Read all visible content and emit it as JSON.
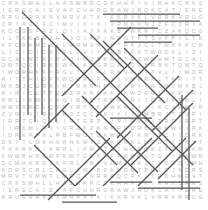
{
  "puzzle": {
    "type": "word-search",
    "title": "Word Search Puzzle",
    "grid_cols": 30,
    "grid_rows": 29,
    "letter_color": "#b9b9b9",
    "strike_color": "#565656",
    "background_color": "#ffffff",
    "rows": [
      "CRKSWHLLHASWRRCDKHHFIKIRHK",
      "JROKCATIERECAIEVAFCUHRGRAW",
      "KTKIKKRVKLVRRKRRUGRRKNXMRV",
      "IFCIMVIKIXIVPNKKNJZFCZRIAZ",
      "ZAKQCGGFRZLQIIAYFKKBIWKRIC",
      "RGTFTSVFPILTKKBRKHLJOIKPIN",
      "RRMVKTKTRKJCLTMKKFCRKMZWIL",
      "IDICXRFLLVIIFHBRFKTWRDKLIZ",
      "RHMTGCAIMTKIRAQIRQSKMKIRZW",
      "RGKJCGBRBKTQMTQCIRKIWKLKMG",
      "RGLIDIHLRKVKCTTVLIIWDRHKKY",
      "ITTHIDFXWQRRIFKIIVMMRKLTKR",
      "ITRTRVMXBJCGRKIRIRKRHPKKIR",
      "RRAFYKWDRRITKRIRICLTTRWZRK",
      "IIXQIBMKTRRMIRIJQAJKRRLIKM",
      "IMWVRMDLQFRYRTCKKWKWZIIIKC",
      "IIQMBRJTZVRIVIRVJROZQCRKIK",
      "TGRPTIRIRVKITRGIRRTCIQKLIR",
      "MLNJIVRZKZKNKRRDRBRKKWIIRK",
      "TCIIDRKFFKLRBFWCTQKWRIIKRI",
      "KQMKLMRDTIDKYTLMKHKRNKWIZR",
      "RLIFRXTNIHGRQKLFPTKKRKKIKR",
      "WRHRCMFKWTGCKKFPRKQLTGIIKW",
      "LTYDRDCMHKRRIKFRLYRFVDMLGK",
      "KFKMRRTRRIFJKDRSCRLCRGLKWI",
      "TLMRQINRRRQCFKITRKHMRVTVMW"
    ]
  },
  "solution_lines": [
    {
      "x1": 20,
      "y1": 27,
      "x2": 20,
      "y2": 140,
      "orientation": "vertical"
    },
    {
      "x1": 28,
      "y1": 27,
      "x2": 28,
      "y2": 115,
      "orientation": "vertical"
    },
    {
      "x1": 35,
      "y1": 38,
      "x2": 35,
      "y2": 122,
      "orientation": "vertical"
    },
    {
      "x1": 42,
      "y1": 38,
      "x2": 42,
      "y2": 115,
      "orientation": "vertical"
    },
    {
      "x1": 49,
      "y1": 45,
      "x2": 49,
      "y2": 128,
      "orientation": "vertical"
    },
    {
      "x1": 56,
      "y1": 45,
      "x2": 56,
      "y2": 122,
      "orientation": "vertical"
    },
    {
      "x1": 182,
      "y1": 95,
      "x2": 182,
      "y2": 190,
      "orientation": "vertical"
    },
    {
      "x1": 189,
      "y1": 108,
      "x2": 189,
      "y2": 200,
      "orientation": "vertical"
    },
    {
      "x1": 103,
      "y1": 14,
      "x2": 180,
      "y2": 14,
      "orientation": "horizontal"
    },
    {
      "x1": 110,
      "y1": 21,
      "x2": 200,
      "y2": 21,
      "orientation": "horizontal"
    },
    {
      "x1": 117,
      "y1": 28,
      "x2": 158,
      "y2": 28,
      "orientation": "horizontal"
    },
    {
      "x1": 138,
      "y1": 35,
      "x2": 200,
      "y2": 35,
      "orientation": "horizontal"
    },
    {
      "x1": 124,
      "y1": 42,
      "x2": 172,
      "y2": 42,
      "orientation": "horizontal"
    },
    {
      "x1": 110,
      "y1": 118,
      "x2": 152,
      "y2": 118,
      "orientation": "horizontal"
    },
    {
      "x1": 138,
      "y1": 188,
      "x2": 200,
      "y2": 188,
      "orientation": "horizontal"
    },
    {
      "x1": 158,
      "y1": 182,
      "x2": 200,
      "y2": 182,
      "orientation": "horizontal"
    },
    {
      "x1": 110,
      "y1": 182,
      "x2": 152,
      "y2": 182,
      "orientation": "horizontal"
    },
    {
      "x1": 20,
      "y1": 195,
      "x2": 96,
      "y2": 195,
      "orientation": "horizontal"
    },
    {
      "x1": 62,
      "y1": 202,
      "x2": 117,
      "y2": 202,
      "orientation": "horizontal"
    },
    {
      "x1": 22,
      "y1": 12,
      "x2": 96,
      "y2": 86,
      "orientation": "diagonal-down"
    },
    {
      "x1": 62,
      "y1": 34,
      "x2": 152,
      "y2": 124,
      "orientation": "diagonal-down"
    },
    {
      "x1": 90,
      "y1": 34,
      "x2": 124,
      "y2": 68,
      "orientation": "diagonal-down"
    },
    {
      "x1": 103,
      "y1": 41,
      "x2": 165,
      "y2": 103,
      "orientation": "diagonal-down"
    },
    {
      "x1": 124,
      "y1": 48,
      "x2": 186,
      "y2": 110,
      "orientation": "diagonal-down"
    },
    {
      "x1": 82,
      "y1": 96,
      "x2": 158,
      "y2": 172,
      "orientation": "diagonal-down"
    },
    {
      "x1": 62,
      "y1": 110,
      "x2": 117,
      "y2": 165,
      "orientation": "diagonal-down"
    },
    {
      "x1": 117,
      "y1": 96,
      "x2": 172,
      "y2": 151,
      "orientation": "diagonal-down"
    },
    {
      "x1": 145,
      "y1": 117,
      "x2": 193,
      "y2": 165,
      "orientation": "diagonal-down"
    },
    {
      "x1": 34,
      "y1": 145,
      "x2": 75,
      "y2": 186,
      "orientation": "diagonal-down"
    },
    {
      "x1": 96,
      "y1": 131,
      "x2": 138,
      "y2": 173,
      "orientation": "diagonal-down"
    },
    {
      "x1": 62,
      "y1": 96,
      "x2": 131,
      "y2": 27,
      "orientation": "diagonal-up"
    },
    {
      "x1": 96,
      "y1": 117,
      "x2": 158,
      "y2": 55,
      "orientation": "diagonal-up"
    },
    {
      "x1": 117,
      "y1": 138,
      "x2": 179,
      "y2": 76,
      "orientation": "diagonal-up"
    },
    {
      "x1": 131,
      "y1": 165,
      "x2": 193,
      "y2": 103,
      "orientation": "diagonal-up"
    },
    {
      "x1": 48,
      "y1": 200,
      "x2": 110,
      "y2": 138,
      "orientation": "diagonal-up"
    },
    {
      "x1": 75,
      "y1": 186,
      "x2": 131,
      "y2": 131,
      "orientation": "diagonal-up"
    },
    {
      "x1": 103,
      "y1": 186,
      "x2": 152,
      "y2": 138,
      "orientation": "diagonal-up"
    },
    {
      "x1": 138,
      "y1": 186,
      "x2": 186,
      "y2": 138,
      "orientation": "diagonal-up"
    },
    {
      "x1": 158,
      "y1": 179,
      "x2": 196,
      "y2": 141,
      "orientation": "diagonal-up"
    },
    {
      "x1": 90,
      "y1": 103,
      "x2": 131,
      "y2": 62,
      "orientation": "diagonal-up"
    },
    {
      "x1": 34,
      "y1": 138,
      "x2": 69,
      "y2": 103,
      "orientation": "diagonal-up"
    },
    {
      "x1": 152,
      "y1": 131,
      "x2": 193,
      "y2": 90,
      "orientation": "diagonal-up"
    }
  ]
}
